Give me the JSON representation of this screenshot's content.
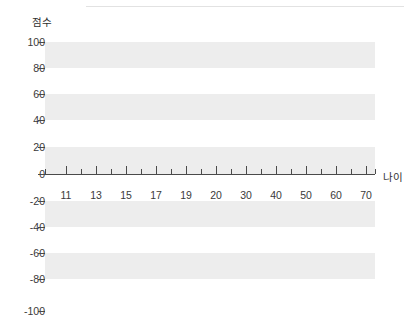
{
  "chart_data": {
    "type": "line",
    "title": "",
    "subtitle": "",
    "xlabel": "나이",
    "ylabel": "점수",
    "grid": false,
    "legend": false,
    "legend_position": "none",
    "series": [],
    "x": [],
    "values": [],
    "annotations": [],
    "ylim": [
      -100,
      100
    ],
    "y_ticks": [
      100,
      80,
      60,
      40,
      20,
      0,
      -20,
      -40,
      -60,
      -80,
      -100
    ],
    "y_tick_labels": [
      "100",
      "80",
      "60",
      "40",
      "20",
      "0",
      "-20",
      "-40",
      "-60",
      "-80",
      "-100"
    ],
    "y_tick_step": 20,
    "x_tick_labels": [
      "11",
      "13",
      "15",
      "17",
      "19",
      "20",
      "30",
      "40",
      "50",
      "60",
      "70"
    ],
    "x_minor_tick_count": 12,
    "band_color": "#ededed",
    "axis_color": "#4a4a4a",
    "text_color": "#3a3a3a",
    "background_color": "#ffffff"
  },
  "axes": {
    "y_title": "점수",
    "x_title": "나이",
    "y_ticks": [
      {
        "label": "100",
        "value": 100,
        "y": 42
      },
      {
        "label": "80",
        "value": 80,
        "y": 68
      },
      {
        "label": "60",
        "value": 60,
        "y": 94
      },
      {
        "label": "40",
        "value": 40,
        "y": 120
      },
      {
        "label": "20",
        "value": 20,
        "y": 147
      },
      {
        "label": "0",
        "value": 0,
        "y": 174
      },
      {
        "label": "-20",
        "value": -20,
        "y": 201
      },
      {
        "label": "-40",
        "value": -40,
        "y": 227
      },
      {
        "label": "-60",
        "value": -60,
        "y": 253
      },
      {
        "label": "-80",
        "value": -80,
        "y": 279
      },
      {
        "label": "-100",
        "value": -100,
        "y": 311
      }
    ],
    "x_major_ticks": [
      {
        "label": "11",
        "x": 66
      },
      {
        "label": "13",
        "x": 96
      },
      {
        "label": "15",
        "x": 126
      },
      {
        "label": "17",
        "x": 156
      },
      {
        "label": "19",
        "x": 186
      },
      {
        "label": "20",
        "x": 216
      },
      {
        "label": "30",
        "x": 246
      },
      {
        "label": "40",
        "x": 276
      },
      {
        "label": "50",
        "x": 306
      },
      {
        "label": "60",
        "x": 336
      },
      {
        "label": "70",
        "x": 366
      }
    ],
    "x_minor_tick_x": [
      45,
      81,
      111,
      141,
      171,
      201,
      231,
      261,
      291,
      321,
      351,
      375
    ],
    "bands": [
      {
        "top": 42,
        "height": 26
      },
      {
        "top": 94,
        "height": 26
      },
      {
        "top": 147,
        "height": 27
      },
      {
        "top": 201,
        "height": 26
      },
      {
        "top": 253,
        "height": 26
      }
    ]
  }
}
